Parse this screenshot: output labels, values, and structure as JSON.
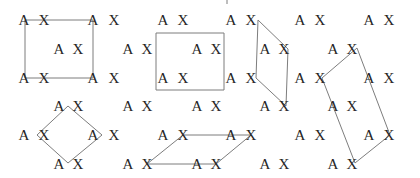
{
  "canvas": {
    "width": 420,
    "height": 178,
    "background": "#ffffff"
  },
  "figure": {
    "pair_letters": [
      "A",
      "X"
    ],
    "text_color": "#262626",
    "line_color": "#7d7d7d",
    "letter_rows": [
      {
        "y": 20,
        "a": [
          24,
          93,
          163,
          231,
          300,
          369
        ],
        "x": [
          44,
          114,
          183,
          251,
          320,
          389
        ]
      },
      {
        "y": 49,
        "a": [
          59,
          128,
          197,
          265,
          333
        ],
        "x": [
          78,
          147,
          216,
          284,
          352
        ]
      },
      {
        "y": 78,
        "a": [
          24,
          93,
          163,
          231,
          300,
          369
        ],
        "x": [
          44,
          114,
          183,
          251,
          320,
          389
        ]
      },
      {
        "y": 106,
        "a": [
          59,
          128,
          197,
          265,
          333
        ],
        "x": [
          78,
          147,
          216,
          284,
          352
        ]
      },
      {
        "y": 135,
        "a": [
          24,
          93,
          163,
          231,
          300,
          369
        ],
        "x": [
          44,
          114,
          183,
          251,
          320,
          389
        ]
      },
      {
        "y": 164,
        "a": [
          59,
          128,
          197,
          265,
          333
        ],
        "x": [
          78,
          147,
          216,
          284,
          352
        ]
      }
    ],
    "shapes": [
      {
        "name": "square",
        "points": [
          [
            25,
            20
          ],
          [
            93,
            20
          ],
          [
            93,
            78
          ],
          [
            25,
            78
          ]
        ]
      },
      {
        "name": "rectangle",
        "points": [
          [
            156,
            33
          ],
          [
            224,
            33
          ],
          [
            224,
            90
          ],
          [
            156,
            90
          ]
        ]
      },
      {
        "name": "narrow-parallelogram",
        "points": [
          [
            258,
            20
          ],
          [
            288,
            49
          ],
          [
            286,
            106
          ],
          [
            256,
            78
          ]
        ]
      },
      {
        "name": "rotated-rectangle",
        "points": [
          [
            357,
            48
          ],
          [
            390,
            135
          ],
          [
            355,
            163
          ],
          [
            322,
            78
          ]
        ]
      },
      {
        "name": "rhombus",
        "points": [
          [
            68,
            106
          ],
          [
            102,
            135
          ],
          [
            68,
            163
          ],
          [
            37,
            135
          ]
        ]
      },
      {
        "name": "wide-parallelogram",
        "points": [
          [
            183,
            135
          ],
          [
            251,
            135
          ],
          [
            216,
            164
          ],
          [
            147,
            164
          ]
        ]
      }
    ],
    "artifact_tick": {
      "x": 227,
      "y1": 0,
      "y2": 4
    }
  }
}
